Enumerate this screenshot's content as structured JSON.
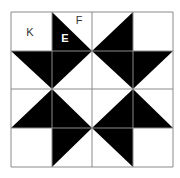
{
  "diagram": {
    "type": "quilt-block-grid",
    "rows": 4,
    "cols": 4,
    "grid": {
      "x": [
        11,
        52,
        92,
        133,
        173
      ],
      "y": [
        12,
        51,
        89,
        128,
        167
      ],
      "line_color": "#8a8a8a",
      "fill_color": "#000000",
      "background": "#ffffff"
    },
    "cells": [
      [
        {
          "fill": "none"
        },
        {
          "fill": "bl"
        },
        {
          "fill": "br"
        },
        {
          "fill": "none"
        }
      ],
      [
        {
          "fill": "tr"
        },
        {
          "fill": "tl"
        },
        {
          "fill": "tr"
        },
        {
          "fill": "tl"
        }
      ],
      [
        {
          "fill": "br"
        },
        {
          "fill": "bl"
        },
        {
          "fill": "br"
        },
        {
          "fill": "bl"
        }
      ],
      [
        {
          "fill": "none"
        },
        {
          "fill": "tl"
        },
        {
          "fill": "tr"
        },
        {
          "fill": "none"
        }
      ]
    ],
    "labels": [
      {
        "id": "K",
        "text": "K",
        "x": 30,
        "y": 36,
        "color": "#333333"
      },
      {
        "id": "F",
        "text": "F",
        "x": 79,
        "y": 24,
        "color": "#333333"
      },
      {
        "id": "E",
        "text": "E",
        "x": 65,
        "y": 42,
        "color": "#ffffff"
      }
    ]
  }
}
